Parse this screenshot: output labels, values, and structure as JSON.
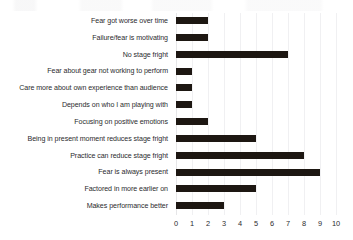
{
  "chart_data": {
    "type": "bar",
    "orientation": "horizontal",
    "title": "",
    "subtitle": "",
    "xlabel": "",
    "ylabel": "",
    "xlim": [
      0,
      10
    ],
    "xticks": [
      "0",
      "1",
      "2",
      "3",
      "4",
      "5",
      "6",
      "7",
      "8",
      "9",
      "10"
    ],
    "grid": true,
    "grid_axis": "x",
    "legend": false,
    "legend_position": "none",
    "bar_color": "#1d1712",
    "background_color": "#ffffff",
    "gridline_color": "#f0f0f2",
    "categories": [
      "Fear got worse over time",
      "Failure/fear is motivating",
      "No stage fright",
      "Fear about gear not working to perform",
      "Care more about own experience than audience",
      "Depends on who I am playing with",
      "Focusing on positive emotions",
      "Being in present moment reduces stage fright",
      "Practice can reduce stage fright",
      "Fear is always present",
      "Factored in more earlier on",
      "Makes performance better"
    ],
    "values": [
      2,
      2,
      7,
      1,
      1,
      1,
      2,
      5,
      8,
      9,
      5,
      3
    ]
  }
}
